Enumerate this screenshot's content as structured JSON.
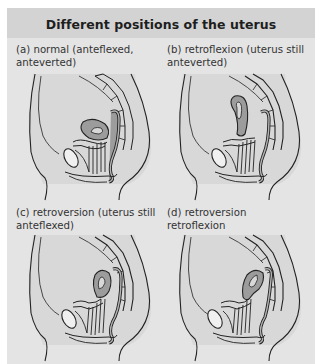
{
  "figure": {
    "title": "Different positions of the uterus",
    "colors": {
      "background": "#e4e4e4",
      "title_bar": "#d3d3d3",
      "title_text": "#1e1e1e",
      "caption_text": "#333333",
      "body_fill": "#d8d8d8",
      "organ_fill": "#9c9c9c",
      "outline": "#222222"
    },
    "panels": [
      {
        "id": "a",
        "caption_line1": "(a) normal (anteflexed,",
        "caption_line2": "anteverted)",
        "uterus_position": "anteflexed-anteverted"
      },
      {
        "id": "b",
        "caption_line1": "(b) retroflexion (uterus still",
        "caption_line2": "anteverted)",
        "uterus_position": "retroflexed-anteverted"
      },
      {
        "id": "c",
        "caption_line1": "(c) retroversion (uterus still",
        "caption_line2": "anteflexed)",
        "uterus_position": "retroverted-anteflexed"
      },
      {
        "id": "d",
        "caption_line1": "(d) retroversion retroflexion",
        "caption_line2": "",
        "uterus_position": "retroverted-retroflexed"
      }
    ]
  }
}
